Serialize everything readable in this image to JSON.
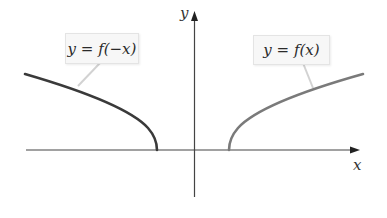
{
  "figure": {
    "type": "function-reflection-graph",
    "axes": {
      "x_label": "x",
      "y_label": "y"
    },
    "curves": [
      {
        "name": "reflected",
        "label": "y = f(−x)",
        "color": "#3a3a3a"
      },
      {
        "name": "original",
        "label": "y = f(x)",
        "color": "#7a7a7a"
      }
    ],
    "colors": {
      "axis": "#444444",
      "label_bg": "#f7f7f7",
      "leader_line": "#cfcfcf"
    }
  }
}
